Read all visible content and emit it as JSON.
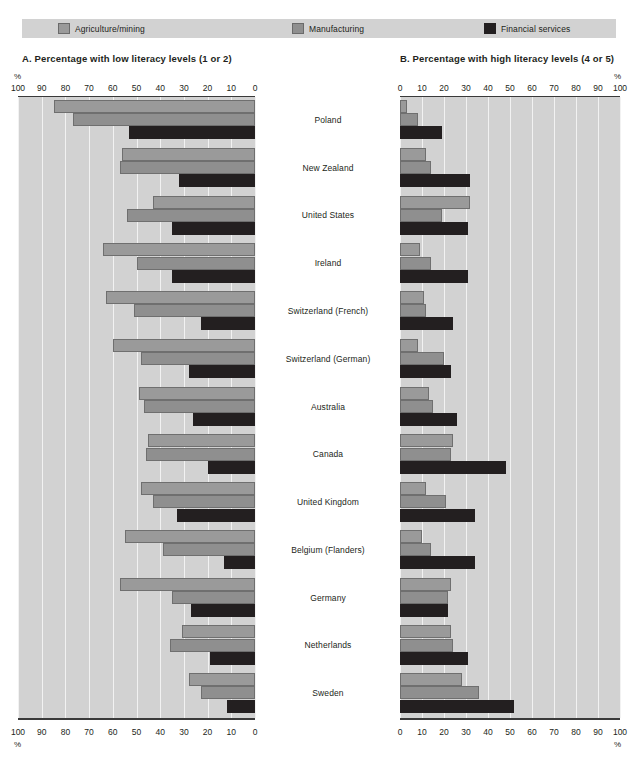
{
  "legend": {
    "items": [
      {
        "label": "Agriculture/mining",
        "icon": "square-swatch-icon",
        "color": "#9a9a9a"
      },
      {
        "label": "Manufacturing",
        "icon": "square-swatch-icon",
        "color": "#8f8f8f"
      },
      {
        "label": "Financial services",
        "icon": "square-swatch-icon",
        "color": "#231f20"
      }
    ]
  },
  "panels": {
    "left": {
      "title": "A.  Percentage with low literacy levels (1 or 2)",
      "pct_symbol": "%",
      "ticks": [
        100,
        90,
        80,
        70,
        60,
        50,
        40,
        30,
        20,
        10,
        0
      ]
    },
    "right": {
      "title": "B.  Percentage with high literacy levels (4 or 5)",
      "pct_symbol": "%",
      "ticks": [
        0,
        10,
        20,
        30,
        40,
        50,
        60,
        70,
        80,
        90,
        100
      ]
    }
  },
  "countries": [
    "Poland",
    "New Zealand",
    "United States",
    "Ireland",
    "Switzerland (French)",
    "Switzerland (German)",
    "Australia",
    "Canada",
    "United Kingdom",
    "Belgium (Flanders)",
    "Germany",
    "Netherlands",
    "Sweden"
  ],
  "chart_data": [
    {
      "type": "bar",
      "orientation": "horizontal-left",
      "title": "A.  Percentage with low literacy levels (1 or 2)",
      "xlabel": "%",
      "ylabel": "",
      "xlim": [
        0,
        100
      ],
      "xticks": [
        100,
        90,
        80,
        70,
        60,
        50,
        40,
        30,
        20,
        10,
        0
      ],
      "grid": true,
      "legend_position": "top",
      "categories": [
        "Poland",
        "New Zealand",
        "United States",
        "Ireland",
        "Switzerland (French)",
        "Switzerland (German)",
        "Australia",
        "Canada",
        "United Kingdom",
        "Belgium (Flanders)",
        "Germany",
        "Netherlands",
        "Sweden"
      ],
      "series": [
        {
          "name": "Agriculture/mining",
          "color": "#9a9a9a",
          "values": [
            85,
            56,
            43,
            64,
            63,
            60,
            49,
            45,
            48,
            55,
            57,
            31,
            28
          ]
        },
        {
          "name": "Manufacturing",
          "color": "#8f8f8f",
          "values": [
            77,
            57,
            54,
            50,
            51,
            48,
            47,
            46,
            43,
            39,
            35,
            36,
            23
          ]
        },
        {
          "name": "Financial services",
          "color": "#231f20",
          "values": [
            53,
            32,
            35,
            35,
            23,
            28,
            26,
            20,
            33,
            13,
            27,
            19,
            12
          ]
        }
      ]
    },
    {
      "type": "bar",
      "orientation": "horizontal-right",
      "title": "B.  Percentage with high literacy levels (4 or 5)",
      "xlabel": "%",
      "ylabel": "",
      "xlim": [
        0,
        100
      ],
      "xticks": [
        0,
        10,
        20,
        30,
        40,
        50,
        60,
        70,
        80,
        90,
        100
      ],
      "grid": true,
      "legend_position": "top",
      "categories": [
        "Poland",
        "New Zealand",
        "United States",
        "Ireland",
        "Switzerland (French)",
        "Switzerland (German)",
        "Australia",
        "Canada",
        "United Kingdom",
        "Belgium (Flanders)",
        "Germany",
        "Netherlands",
        "Sweden"
      ],
      "series": [
        {
          "name": "Agriculture/mining",
          "color": "#9a9a9a",
          "values": [
            3,
            12,
            32,
            9,
            11,
            8,
            13,
            24,
            12,
            10,
            23,
            23,
            28
          ]
        },
        {
          "name": "Manufacturing",
          "color": "#8f8f8f",
          "values": [
            8,
            14,
            19,
            14,
            12,
            20,
            15,
            23,
            21,
            14,
            22,
            24,
            36
          ]
        },
        {
          "name": "Financial services",
          "color": "#231f20",
          "values": [
            19,
            32,
            31,
            31,
            24,
            23,
            26,
            48,
            34,
            34,
            22,
            31,
            52
          ]
        }
      ]
    }
  ]
}
